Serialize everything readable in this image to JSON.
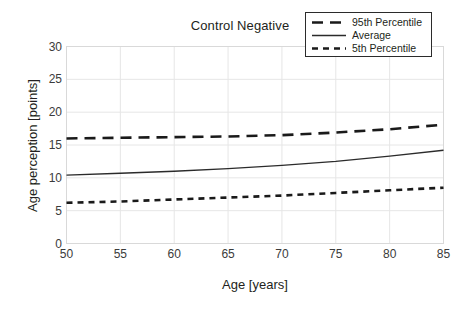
{
  "chart_data": {
    "type": "line",
    "title": "Control Negative",
    "xlabel": "Age [years]",
    "ylabel": "Age perception [points]",
    "xlim": [
      50,
      85
    ],
    "ylim": [
      0,
      30
    ],
    "xticks": [
      50,
      55,
      60,
      65,
      70,
      75,
      80,
      85
    ],
    "yticks": [
      0,
      5,
      10,
      15,
      20,
      25,
      30
    ],
    "grid": true,
    "legend_position": "top-right",
    "x": [
      50,
      55,
      60,
      65,
      70,
      75,
      80,
      85
    ],
    "series": [
      {
        "name": "95th Percentile",
        "style": "long-dash",
        "color": "#1a1a1a",
        "values": [
          16.0,
          16.1,
          16.2,
          16.3,
          16.5,
          16.9,
          17.4,
          18.1
        ]
      },
      {
        "name": "Average",
        "style": "solid",
        "color": "#2b2b2b",
        "values": [
          10.4,
          10.7,
          11.0,
          11.4,
          11.9,
          12.5,
          13.3,
          14.2
        ]
      },
      {
        "name": "5th Percentile",
        "style": "short-dash",
        "color": "#1a1a1a",
        "values": [
          6.2,
          6.4,
          6.7,
          7.0,
          7.3,
          7.7,
          8.1,
          8.5
        ]
      }
    ]
  },
  "legend": {
    "items": [
      {
        "label": "95th Percentile"
      },
      {
        "label": "Average"
      },
      {
        "label": "5th Percentile"
      }
    ]
  },
  "colors": {
    "grid": "#e6e6e6",
    "axis_border": "#d9d9d9",
    "ink": "#231f20",
    "tick_text": "#3b3b3b"
  }
}
